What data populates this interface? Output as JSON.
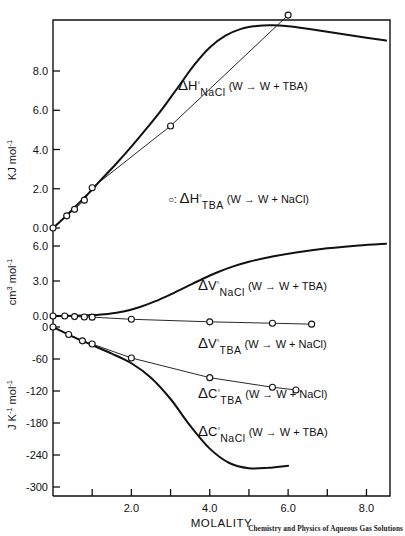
{
  "figure": {
    "credit": "Chemistry and Physics of Aqueous Gas Solutions",
    "frame_color": "#111111"
  },
  "axes": {
    "x": {
      "title": "MOLALITY",
      "ticklabels": [
        "2.0",
        "4.0",
        "6.0",
        "8.0"
      ],
      "tickvalues": [
        2.0,
        4.0,
        6.0,
        8.0
      ],
      "minorticks": [
        1.0,
        3.0,
        5.0,
        7.0
      ],
      "range": [
        0.0,
        8.6
      ]
    },
    "y_top": {
      "title_main": "KJ mol",
      "title_sup": "-1",
      "ticklabels": [
        "8.0",
        "6.0",
        "4.0",
        "2.0",
        "0.0"
      ],
      "tickvalues": [
        8.0,
        6.0,
        4.0,
        2.0,
        0.0
      ],
      "range": [
        0.0,
        10.6
      ]
    },
    "y_mid": {
      "title_main": "cm",
      "title_sup1": "3",
      "title_main2": " mol",
      "title_sup2": "-1",
      "ticklabels": [
        "6.0",
        "3.0",
        "0.0"
      ],
      "tickvalues": [
        6.0,
        3.0,
        0.0
      ],
      "range": [
        0.0,
        7.0
      ]
    },
    "y_bottom": {
      "title_main": "J  K",
      "title_sup1": "-1",
      "title_main2": " mol",
      "title_sup2": "-1",
      "ticklabels": [
        "0",
        "-60",
        "-120",
        "-180",
        "-240",
        "-300"
      ],
      "tickvalues": [
        0,
        -60,
        -120,
        -180,
        -240,
        -300
      ],
      "range": [
        -320,
        10
      ]
    }
  },
  "series_labels": {
    "dh_nacl": {
      "delta": "Δ",
      "symbol": "H",
      "degree": "°",
      "subscript": "NaCl",
      "process": "(W → W + TBA)"
    },
    "dh_tba": {
      "marker_prefix": "○:",
      "delta": "Δ",
      "symbol": "H",
      "degree": "°",
      "subscript": "TBA",
      "process": "(W → W + NaCl)"
    },
    "dv_nacl": {
      "delta": "Δ",
      "symbol": "V",
      "degree": "°",
      "subscript": "NaCl",
      "process": "(W → W + TBA)"
    },
    "dv_tba": {
      "delta": "Δ",
      "symbol": "V",
      "degree": "°",
      "subscript": "TBA",
      "process": "(W → W + NaCl)"
    },
    "dc_tba": {
      "delta": "Δ",
      "symbol": "C",
      "degree": "°",
      "subscript": "TBA",
      "process": "(W → W + NaCl)"
    },
    "dc_nacl": {
      "delta": "Δ",
      "symbol": "C",
      "degree": "°",
      "subscript": "NaCl",
      "process": "(W → W + TBA)"
    }
  },
  "chart_data": {
    "type": "line",
    "title": "",
    "xlabel": "MOLALITY",
    "panels": [
      {
        "name": "enthalpy",
        "ylabel": "KJ mol-1",
        "ylim": [
          0.0,
          10.6
        ],
        "series": [
          {
            "name": "dH_NaCl (W -> W + TBA)",
            "style": "thick-curve",
            "markers": false,
            "x": [
              0.0,
              0.3,
              0.6,
              0.9,
              1.2,
              1.6,
              2.0,
              2.4,
              2.8,
              3.2,
              3.6,
              4.0,
              4.4,
              4.8,
              5.2,
              5.6,
              6.0,
              6.5,
              7.0,
              7.5,
              8.0,
              8.5
            ],
            "y": [
              0.0,
              0.55,
              1.15,
              1.75,
              2.4,
              3.25,
              4.15,
              5.1,
              6.1,
              7.2,
              8.3,
              9.2,
              9.8,
              10.15,
              10.3,
              10.33,
              10.28,
              10.15,
              10.0,
              9.85,
              9.7,
              9.55
            ]
          },
          {
            "name": "dH_TBA (W -> W + NaCl)",
            "style": "thin-line-with-open-circles",
            "markers": true,
            "x": [
              0.0,
              0.35,
              0.55,
              0.8,
              1.0,
              3.0,
              6.0
            ],
            "y": [
              0.0,
              0.62,
              0.95,
              1.42,
              2.05,
              5.2,
              10.85
            ]
          }
        ]
      },
      {
        "name": "volume",
        "ylabel": "cm3 mol-1",
        "ylim": [
          0.0,
          7.0
        ],
        "series": [
          {
            "name": "dV_NaCl (W -> W + TBA)",
            "style": "thick-curve",
            "markers": false,
            "x": [
              0.0,
              0.5,
              1.0,
              1.4,
              1.8,
              2.2,
              2.6,
              3.0,
              3.4,
              3.8,
              4.2,
              4.6,
              5.0,
              5.6,
              6.2,
              7.0,
              7.8,
              8.5
            ],
            "y": [
              0.0,
              0.02,
              0.08,
              0.18,
              0.38,
              0.75,
              1.25,
              1.85,
              2.5,
              3.15,
              3.75,
              4.25,
              4.65,
              5.1,
              5.45,
              5.8,
              6.05,
              6.2
            ]
          },
          {
            "name": "dV_TBA (W -> W + NaCl)",
            "style": "thin-line-with-open-circles",
            "markers": true,
            "x": [
              0.0,
              0.3,
              0.55,
              0.8,
              1.0,
              2.0,
              4.0,
              5.6,
              6.6
            ],
            "y": [
              0.0,
              0.0,
              -0.05,
              -0.08,
              -0.1,
              -0.28,
              -0.5,
              -0.62,
              -0.7
            ]
          }
        ]
      },
      {
        "name": "heat-capacity",
        "ylabel": "J K-1 mol-1",
        "ylim": [
          -320,
          10
        ],
        "series": [
          {
            "name": "dC_TBA (W -> W + NaCl)",
            "style": "thin-line-with-open-circles",
            "markers": true,
            "x": [
              0.0,
              0.4,
              0.75,
              1.0,
              2.0,
              4.0,
              5.6,
              6.2
            ],
            "y": [
              0,
              -14,
              -26,
              -32,
              -58,
              -95,
              -113,
              -118
            ]
          },
          {
            "name": "dC_NaCl (W -> W + TBA)",
            "style": "thick-curve",
            "markers": false,
            "x": [
              0.0,
              0.5,
              1.0,
              1.5,
              2.0,
              2.5,
              3.0,
              3.5,
              4.0,
              4.5,
              5.0,
              5.5,
              6.0
            ],
            "y": [
              0,
              -18,
              -34,
              -50,
              -68,
              -95,
              -135,
              -185,
              -228,
              -255,
              -265,
              -264,
              -260
            ]
          }
        ]
      }
    ],
    "grid": false,
    "legend_position": "inline-annotations"
  }
}
